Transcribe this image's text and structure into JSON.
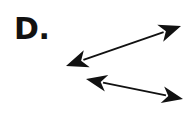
{
  "figure": {
    "label": "D.",
    "label_color": "#111111",
    "background_color": "#ffffff",
    "stroke_color": "#111111",
    "width": 192,
    "height": 127,
    "arrows": [
      {
        "name": "upper-arrow",
        "heads": "double",
        "x1": 66,
        "y1": 66,
        "x2": 181,
        "y2": 26,
        "shaft_width": 1.8,
        "head_length": 22,
        "head_half_width": 9,
        "head_notch": 6,
        "direction": "rises left to right"
      },
      {
        "name": "lower-arrow",
        "heads": "double",
        "x1": 86,
        "y1": 79,
        "x2": 183,
        "y2": 99,
        "shaft_width": 1.8,
        "head_length": 21,
        "head_half_width": 8.5,
        "head_notch": 6,
        "direction": "falls left to right"
      }
    ]
  }
}
